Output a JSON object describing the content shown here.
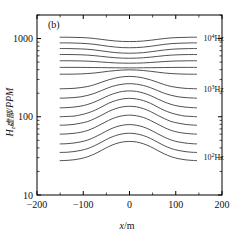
{
  "figure": {
    "panel_label": "(b)",
    "background": "#ffffff",
    "curve_color": "#3d3d3d",
    "axis_color": "#000000"
  },
  "chart_data": {
    "type": "line",
    "title": "",
    "subtitle": "",
    "panel": "(b)",
    "xlabel": "x/m",
    "ylabel": "H_z虚部/PPM",
    "ylabel_parts": {
      "symbol": "H",
      "subscript": "z",
      "cjk": "虚部",
      "unit": "/PPM"
    },
    "xlim": [
      -200,
      200
    ],
    "ylim": [
      10,
      2000
    ],
    "yscale": "log",
    "xscale": "linear",
    "grid": false,
    "legend_position": "inline-right",
    "xticks": [
      -200,
      -100,
      0,
      100,
      200
    ],
    "xticklabels": [
      "-200",
      "-100",
      "0",
      "100",
      "200"
    ],
    "yticks": [
      10,
      100,
      1000
    ],
    "yticklabels": [
      "10",
      "100",
      "1000"
    ],
    "annotations": [
      {
        "text": "10⁴Hz",
        "base": "10",
        "exponent": "4",
        "unit": "Hz",
        "x": 160,
        "y_value": 1030
      },
      {
        "text": "10³Hz",
        "base": "10",
        "exponent": "3",
        "unit": "Hz",
        "x": 160,
        "y_value": 228
      },
      {
        "text": "10²Hz",
        "base": "10",
        "exponent": "2",
        "unit": "Hz",
        "x": 160,
        "y_value": 31
      }
    ],
    "x": [
      -150,
      -135,
      -120,
      -105,
      -90,
      -75,
      -60,
      -45,
      -30,
      -15,
      0,
      15,
      30,
      45,
      60,
      75,
      90,
      105,
      120,
      135,
      145
    ],
    "series": [
      {
        "name": "10^4 Hz",
        "label": "10⁴Hz",
        "values": [
          1040,
          1040,
          1035,
          1030,
          1020,
          1000,
          975,
          950,
          930,
          918,
          915,
          918,
          930,
          950,
          975,
          1000,
          1020,
          1030,
          1035,
          1040,
          1040
        ]
      },
      {
        "name": "curve-2",
        "label": "",
        "values": [
          880,
          880,
          876,
          870,
          860,
          842,
          818,
          795,
          778,
          766,
          763,
          766,
          778,
          795,
          818,
          842,
          860,
          870,
          876,
          880,
          880
        ]
      },
      {
        "name": "curve-3",
        "label": "",
        "values": [
          745,
          745,
          742,
          737,
          729,
          714,
          695,
          676,
          661,
          652,
          649,
          652,
          661,
          676,
          695,
          714,
          729,
          737,
          742,
          745,
          745
        ]
      },
      {
        "name": "curve-4",
        "label": "",
        "values": [
          625,
          625,
          623,
          620,
          614,
          604,
          591,
          578,
          568,
          562,
          560,
          562,
          568,
          578,
          591,
          604,
          614,
          620,
          623,
          625,
          625
        ]
      },
      {
        "name": "curve-5",
        "label": "",
        "values": [
          520,
          520,
          519,
          517,
          514,
          508,
          501,
          494,
          488,
          485,
          484,
          485,
          488,
          494,
          501,
          508,
          514,
          517,
          519,
          520,
          520
        ]
      },
      {
        "name": "curve-6",
        "label": "",
        "values": [
          428,
          428,
          428,
          428,
          427,
          426,
          425,
          424,
          423,
          422,
          422,
          422,
          423,
          424,
          425,
          426,
          427,
          428,
          428,
          428,
          428
        ]
      },
      {
        "name": "curve-7",
        "label": "",
        "values": [
          350,
          350,
          351,
          353,
          357,
          363,
          372,
          382,
          390,
          396,
          398,
          396,
          390,
          382,
          372,
          363,
          357,
          353,
          351,
          350,
          350
        ]
      },
      {
        "name": "10^3 Hz",
        "label": "10³Hz",
        "values": [
          228,
          229,
          231,
          236,
          244,
          258,
          277,
          297,
          313,
          324,
          328,
          324,
          313,
          297,
          277,
          258,
          244,
          236,
          231,
          229,
          228
        ]
      },
      {
        "name": "curve-9",
        "label": "",
        "values": [
          173,
          174,
          176,
          180,
          188,
          200,
          217,
          236,
          251,
          261,
          265,
          261,
          251,
          236,
          217,
          200,
          188,
          180,
          176,
          174,
          173
        ]
      },
      {
        "name": "curve-10",
        "label": "",
        "values": [
          130,
          131,
          133,
          137,
          144,
          155,
          170,
          187,
          201,
          211,
          214,
          211,
          201,
          187,
          170,
          155,
          144,
          137,
          133,
          131,
          130
        ]
      },
      {
        "name": "curve-11",
        "label": "",
        "values": [
          100,
          101,
          102,
          106,
          112,
          121,
          134,
          149,
          161,
          169,
          172,
          169,
          161,
          149,
          134,
          121,
          112,
          106,
          102,
          101,
          100
        ]
      },
      {
        "name": "curve-12",
        "label": "",
        "values": [
          78,
          78.5,
          80,
          83,
          87,
          95,
          105,
          117,
          127,
          134,
          136,
          134,
          127,
          117,
          105,
          95,
          87,
          83,
          80,
          78.5,
          78
        ]
      },
      {
        "name": "curve-13",
        "label": "",
        "values": [
          60,
          60.4,
          61.5,
          63.5,
          67,
          73,
          81,
          90,
          98,
          103,
          105,
          103,
          98,
          90,
          81,
          73,
          67,
          63.5,
          61.5,
          60.4,
          60
        ]
      },
      {
        "name": "curve-14",
        "label": "",
        "values": [
          45,
          45.3,
          46.2,
          47.8,
          50.5,
          55,
          61,
          68,
          74,
          78,
          79.5,
          78,
          74,
          68,
          61,
          55,
          50.5,
          47.8,
          46.2,
          45.3,
          45
        ]
      },
      {
        "name": "curve-15",
        "label": "",
        "values": [
          35,
          35.2,
          35.9,
          37.2,
          39.3,
          42.8,
          47.5,
          53,
          57.5,
          60.5,
          61.6,
          60.5,
          57.5,
          53,
          47.5,
          42.8,
          39.3,
          37.2,
          35.9,
          35.2,
          35
        ]
      },
      {
        "name": "10^2 Hz",
        "label": "10²Hz",
        "values": [
          27.5,
          27.7,
          28.2,
          29.2,
          30.9,
          33.6,
          37.3,
          41.6,
          45.2,
          47.6,
          48.4,
          47.6,
          45.2,
          41.6,
          37.3,
          33.6,
          30.9,
          29.2,
          28.2,
          27.7,
          27.5
        ]
      }
    ]
  }
}
